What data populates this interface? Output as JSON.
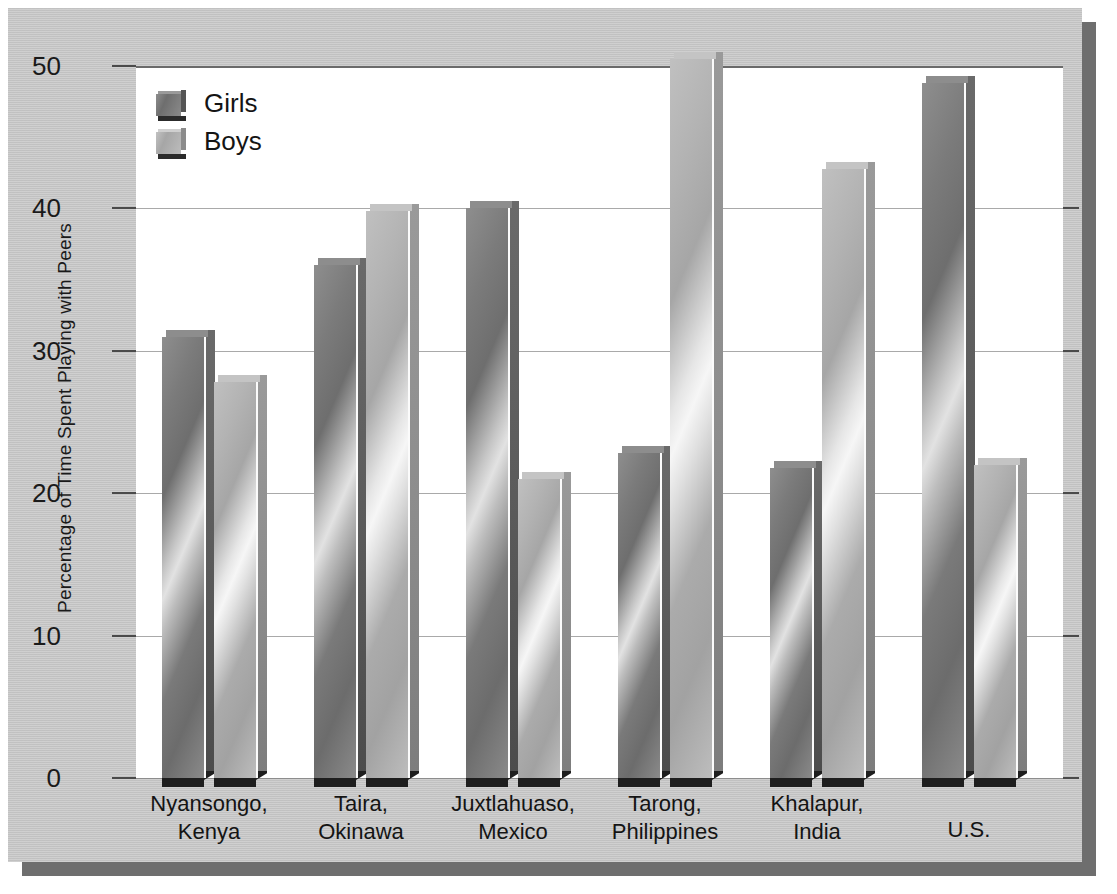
{
  "chart_data": {
    "type": "bar",
    "title": "",
    "xlabel": "",
    "ylabel": "Percentage of Time Spent Playing with Peers",
    "ylim": [
      0,
      50
    ],
    "yticks": [
      0,
      10,
      20,
      30,
      40,
      50
    ],
    "ytick_labels": [
      "0",
      "10",
      "20",
      "30",
      "40",
      "50"
    ],
    "grid": true,
    "legend_position": "top-left",
    "categories": [
      "Nyansongo,\nKenya",
      "Taira,\nOkinawa",
      "Juxtlahuaso,\nMexico",
      "Tarong,\nPhilippines",
      "Khalapur,\nIndia",
      "U.S."
    ],
    "series": [
      {
        "name": "Girls",
        "color": "#767676",
        "values": [
          31,
          36,
          40,
          22.8,
          21.8,
          48.8
        ]
      },
      {
        "name": "Boys",
        "color": "#b2b2b2",
        "values": [
          27.8,
          39.8,
          21,
          50.5,
          42.8,
          22
        ]
      }
    ]
  },
  "axis": {
    "y_title": "Percentage of Time Spent Playing with Peers",
    "ticks": [
      {
        "value": 50,
        "label": "50"
      },
      {
        "value": 40,
        "label": "40"
      },
      {
        "value": 30,
        "label": "30"
      },
      {
        "value": 20,
        "label": "20"
      },
      {
        "value": 10,
        "label": "10"
      },
      {
        "value": 0,
        "label": "0"
      }
    ]
  },
  "legend": {
    "items": [
      {
        "label": "Girls",
        "key": "girls"
      },
      {
        "label": "Boys",
        "key": "boys"
      }
    ]
  },
  "groups": [
    {
      "label_line1": "Nyansongo,",
      "label_line2": "Kenya",
      "girls": 31,
      "boys": 27.8
    },
    {
      "label_line1": "Taira,",
      "label_line2": "Okinawa",
      "girls": 36,
      "boys": 39.8
    },
    {
      "label_line1": "Juxtlahuaso,",
      "label_line2": "Mexico",
      "girls": 40,
      "boys": 21
    },
    {
      "label_line1": "Tarong,",
      "label_line2": "Philippines",
      "girls": 22.8,
      "boys": 50.5
    },
    {
      "label_line1": "Khalapur,",
      "label_line2": "India",
      "girls": 21.8,
      "boys": 42.8
    },
    {
      "label_line1": "U.S.",
      "label_line2": "",
      "girls": 48.8,
      "boys": 22
    }
  ],
  "colors": {
    "card_background": "#c9c9c9",
    "plot_background": "#ffffff",
    "shadow": "#6e6e6e",
    "gridline": "#a9a9a9",
    "text": "#141414"
  }
}
